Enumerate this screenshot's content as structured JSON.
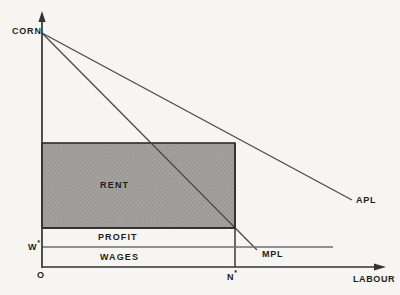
{
  "figure": {
    "type": "economics-diagram",
    "colors": {
      "background": "#f6f5f1",
      "axis": "#333333",
      "curve": "#4a4a4a",
      "wage_line": "#6f6f6f",
      "rent_fill": "#a5a3a0",
      "rent_dot": "#8b8986",
      "rent_border": "#2b2b2b",
      "text": "#1d1d1d"
    },
    "labels": {
      "y_axis": "CORN",
      "x_axis": "LABOUR",
      "origin": "O",
      "apl_curve": "APL",
      "mpl_curve": "MPL",
      "rent_area": "RENT",
      "profit_area": "PROFIT",
      "wages_area": "WAGES",
      "wage_level": {
        "base": "W",
        "sup": "*"
      },
      "employment_level": {
        "base": "N",
        "sup": "*"
      }
    }
  }
}
